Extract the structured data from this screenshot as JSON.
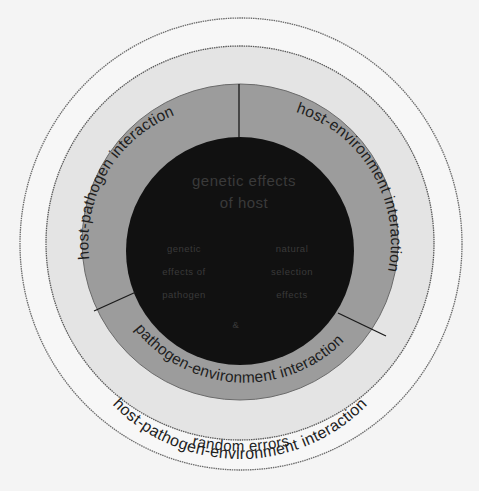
{
  "diagram": {
    "colors": {
      "background": "#f4f4f4",
      "outer_band": "#f7f7f7",
      "middle_band": "#e6e6e6",
      "interaction_ring": "#9a9a9a",
      "core": "#111111",
      "outline": "#5a5a5a",
      "text": "#1e1e1e"
    },
    "rings": {
      "outermost": {
        "label": "random errors"
      },
      "middle": {
        "label": "host-pathogen-environment interaction"
      },
      "two_way_interactions": [
        {
          "id": "host-pathogen",
          "label": "host-pathogen interaction"
        },
        {
          "id": "host-environment",
          "label": "host-environment interaction"
        },
        {
          "id": "pathogen-environment",
          "label": "pathogen-environment interaction"
        }
      ],
      "core": {
        "title_line1": "genetic effects",
        "title_line2": "of host",
        "left_block": [
          "genetic",
          "effects of",
          "pathogen"
        ],
        "right_block": [
          "natural",
          "selection",
          "effects"
        ],
        "bottom_mark": "&"
      }
    }
  }
}
